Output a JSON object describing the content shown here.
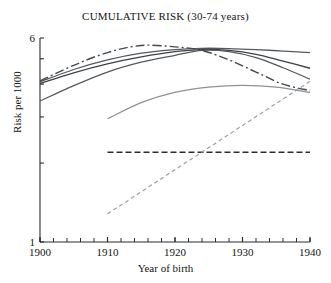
{
  "chart_data": {
    "type": "line",
    "title": "CUMULATIVE RISK (30-74 years)",
    "xlabel": "Year of birth",
    "ylabel": "Risk per 1000",
    "xlim": [
      1900,
      1940
    ],
    "ylim": [
      1,
      6
    ],
    "yscale": "log",
    "grid": false,
    "legend": "none",
    "xticks": [
      1900,
      1910,
      1920,
      1930,
      1940
    ],
    "xtick_labels": [
      "1900",
      "1910",
      "1920",
      "1930",
      "1940"
    ],
    "xminor_tick_step": 2,
    "yticks": [
      1,
      2,
      3,
      4,
      5,
      6
    ],
    "ytick_labels": [
      "1",
      "",
      "",
      "",
      "",
      "6"
    ],
    "series": [
      {
        "name": "curve-1-solid-dark-upper",
        "style": "solid",
        "color": "#555a5e",
        "width": 1.3,
        "x": [
          1900,
          1905,
          1910,
          1915,
          1920,
          1924,
          1928,
          1932,
          1936,
          1940
        ],
        "values": [
          4.08,
          4.55,
          4.95,
          5.25,
          5.42,
          5.48,
          5.47,
          5.42,
          5.35,
          5.28
        ]
      },
      {
        "name": "curve-2-solid-dark-middle",
        "style": "solid",
        "color": "#3e4246",
        "width": 1.3,
        "x": [
          1900,
          1905,
          1910,
          1915,
          1920,
          1924,
          1928,
          1932,
          1936,
          1940
        ],
        "values": [
          4.02,
          4.42,
          4.78,
          5.08,
          5.32,
          5.42,
          5.38,
          5.2,
          4.9,
          4.6
        ]
      },
      {
        "name": "curve-3-solid-dark-lower",
        "style": "solid",
        "color": "#55595d",
        "width": 1.3,
        "x": [
          1900,
          1905,
          1910,
          1915,
          1920,
          1924,
          1928,
          1932,
          1936,
          1940
        ],
        "values": [
          3.45,
          3.95,
          4.45,
          4.85,
          5.15,
          5.38,
          5.32,
          5.05,
          4.62,
          4.18
        ]
      },
      {
        "name": "curve-4-dash-dot-peak",
        "style": "dashdot",
        "color": "#44484c",
        "width": 1.4,
        "x": [
          1900,
          1905,
          1910,
          1915,
          1920,
          1924,
          1928,
          1932,
          1936,
          1940
        ],
        "values": [
          4.12,
          4.72,
          5.28,
          5.62,
          5.55,
          5.38,
          4.95,
          4.45,
          4.0,
          3.78
        ]
      },
      {
        "name": "curve-5-solid-light-late-start",
        "style": "solid",
        "color": "#8d9296",
        "width": 1.2,
        "x": [
          1910,
          1915,
          1920,
          1925,
          1930,
          1935,
          1940
        ],
        "values": [
          2.95,
          3.4,
          3.72,
          3.9,
          3.96,
          3.9,
          3.72
        ]
      },
      {
        "name": "line-6-dashed-flat",
        "style": "dashed",
        "color": "#2a2d30",
        "width": 1.6,
        "x": [
          1910,
          1940
        ],
        "values": [
          2.2,
          2.2
        ]
      },
      {
        "name": "line-7-dashed-rising",
        "style": "dashed-fine",
        "color": "#9aa0a4",
        "width": 1.2,
        "x": [
          1910,
          1940
        ],
        "values": [
          1.28,
          4.1
        ]
      }
    ]
  }
}
